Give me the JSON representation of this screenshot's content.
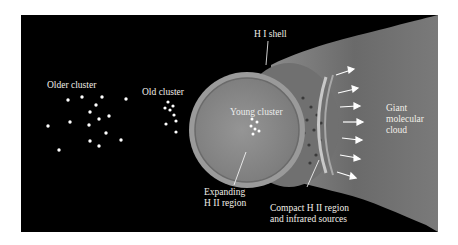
{
  "diagram": {
    "labels": {
      "older_cluster": "Older cluster",
      "old_cluster": "Old cluster",
      "young_cluster": "Young cluster",
      "hi_shell": "H I shell",
      "expanding_line1": "Expanding",
      "expanding_line2": "H II region",
      "compact_line1": "Compact H II region",
      "compact_line2": "and infrared sources",
      "gmc_line1": "Giant",
      "gmc_line2": "molecular",
      "gmc_line3": "cloud"
    },
    "colors": {
      "background": "#000000",
      "cloud": "#6e6e6e",
      "bubble": "#8a8a8a",
      "shell": "#b5b5b5",
      "stars": "#ffffff",
      "text": "#f2efe8"
    },
    "icons": [
      "star-dot",
      "arrow-right"
    ]
  }
}
